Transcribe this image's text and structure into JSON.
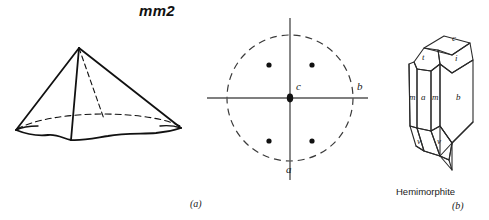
{
  "figure": {
    "point_group": "mm2",
    "subcaption_a": "(a)",
    "subcaption_b": "(b)",
    "mineral_name": "Hemimorphite",
    "background_color": "#ffffff",
    "ink_color": "#111111"
  },
  "panel_a": {
    "name": "pyramid-and-stereogram",
    "crystal_form": {
      "name": "pyramid",
      "description": "four-sided pyramid with apex up and irregular base"
    },
    "stereogram": {
      "primitive_circle": "dashed",
      "center_marker": "filled-dot",
      "axis_labels": {
        "c": "c",
        "a": "a",
        "b": "b"
      },
      "pole_count": 4,
      "pole_symbol": "filled-dot",
      "poles": [
        {
          "label": "pole-upper-left",
          "x": -0.33,
          "y": 0.52
        },
        {
          "label": "pole-upper-right",
          "x": 0.33,
          "y": 0.52
        },
        {
          "label": "pole-lower-left",
          "x": -0.33,
          "y": -0.52
        },
        {
          "label": "pole-lower-right",
          "x": 0.33,
          "y": -0.52
        }
      ]
    }
  },
  "panel_b": {
    "name": "hemimorphite-crystal",
    "face_labels": [
      {
        "id": "face-c",
        "text": "c"
      },
      {
        "id": "face-t",
        "text": "t"
      },
      {
        "id": "face-i",
        "text": "i"
      },
      {
        "id": "face-m-left",
        "text": "m"
      },
      {
        "id": "face-a",
        "text": "a"
      },
      {
        "id": "face-m-mid",
        "text": "m"
      },
      {
        "id": "face-b",
        "text": "b"
      },
      {
        "id": "face-v-left",
        "text": "v"
      },
      {
        "id": "face-v-right",
        "text": "v"
      }
    ]
  }
}
